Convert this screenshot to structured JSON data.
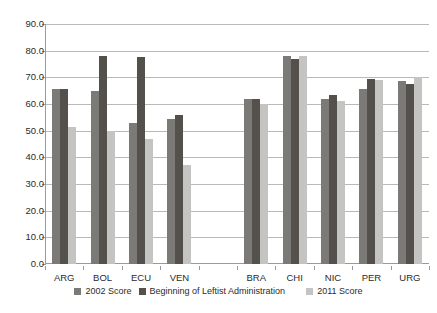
{
  "chart_data": {
    "type": "bar",
    "title": "",
    "xlabel": "",
    "ylabel": "",
    "ylim": [
      0.0,
      90.0
    ],
    "ytick_step": 10.0,
    "grid": true,
    "legend_position": "bottom",
    "categories": [
      "ARG",
      "BOL",
      "ECU",
      "VEN",
      "",
      "BRA",
      "CHI",
      "NIC",
      "PER",
      "URG"
    ],
    "ytick_labels": [
      "90.0",
      "80.0",
      "70.0",
      "60.0",
      "50.0",
      "40.0",
      "30.0",
      "20.0",
      "10.0",
      "0.0"
    ],
    "ytick_values": [
      90.0,
      80.0,
      70.0,
      60.0,
      50.0,
      40.0,
      30.0,
      20.0,
      10.0,
      0.0
    ],
    "series": [
      {
        "name": "2002 Score",
        "color": "#7b7a77",
        "values": [
          65.5,
          65.0,
          53.0,
          54.5,
          null,
          61.8,
          78.0,
          62.0,
          65.5,
          68.5
        ]
      },
      {
        "name": "Beginning of Leftist Administration",
        "color": "#54504b",
        "values": [
          65.5,
          78.0,
          77.5,
          56.0,
          null,
          62.0,
          77.0,
          63.5,
          69.5,
          67.5
        ]
      },
      {
        "name": "2011 Score",
        "color": "#c4c4c2",
        "values": [
          51.5,
          50.0,
          47.0,
          37.0,
          null,
          60.0,
          78.0,
          61.0,
          69.0,
          70.0
        ]
      }
    ]
  }
}
